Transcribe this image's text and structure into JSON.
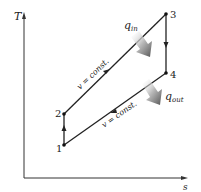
{
  "diagram": {
    "type": "T-s diagram (Otto cycle)",
    "axes": {
      "y_label": "T",
      "x_label": "s"
    },
    "states": [
      {
        "id": "1",
        "label": "1",
        "x": 64,
        "y": 145
      },
      {
        "id": "2",
        "label": "2",
        "x": 64,
        "y": 114
      },
      {
        "id": "3",
        "label": "3",
        "x": 166,
        "y": 14
      },
      {
        "id": "4",
        "label": "4",
        "x": 166,
        "y": 73
      }
    ],
    "processes": [
      {
        "from": "1",
        "to": "2",
        "label": ""
      },
      {
        "from": "2",
        "to": "3",
        "label": "v = const."
      },
      {
        "from": "3",
        "to": "4",
        "label": ""
      },
      {
        "from": "4",
        "to": "1",
        "label": "v = const."
      }
    ],
    "heat_flows": {
      "q_in": {
        "symbol": "q",
        "subscript": "in"
      },
      "q_out": {
        "symbol": "q",
        "subscript": "out"
      }
    },
    "colors": {
      "line": "#222222",
      "arrow_shade": "#888888"
    }
  }
}
